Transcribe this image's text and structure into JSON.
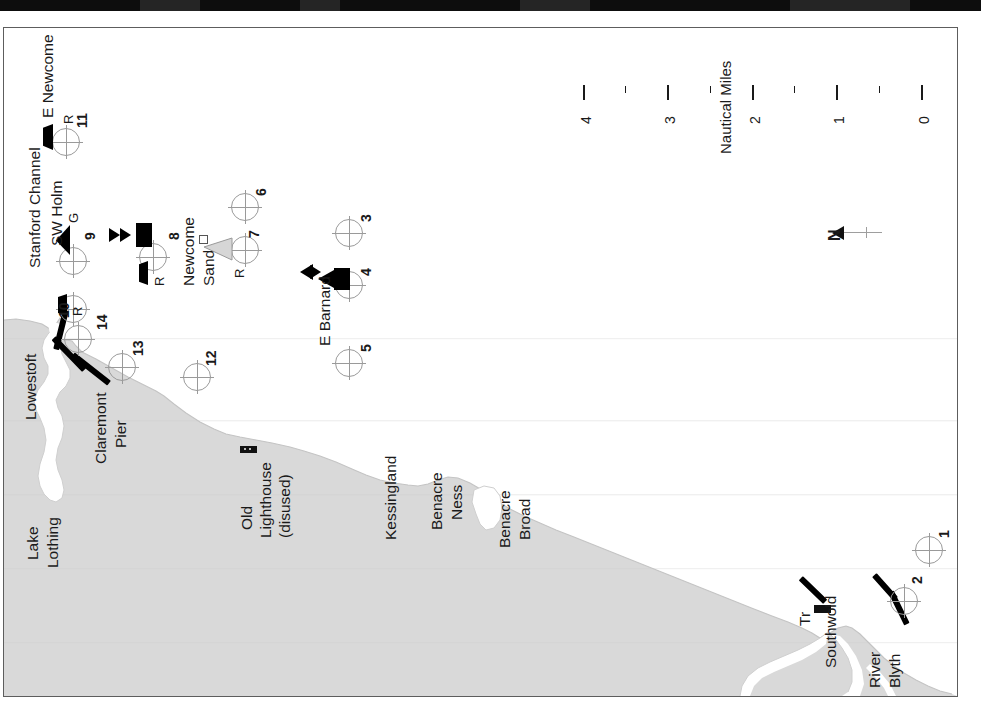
{
  "chart": {
    "kind": "nautical-chart",
    "orientation_note": "N",
    "background_color": "#ffffff",
    "land_color": "#d9d9d9",
    "water_color": "#ffffff",
    "frame_color": "#5d5d5d"
  },
  "scale": {
    "title": "Nautical Miles",
    "major_labels": [
      "0",
      "1",
      "2",
      "3",
      "4"
    ],
    "major_count": 5,
    "minor_count": 4,
    "units": "Nautical Miles"
  },
  "north": {
    "label": "N"
  },
  "places": [
    {
      "name": "Lowestoft"
    },
    {
      "name": "Lake"
    },
    {
      "name": "Lothing"
    },
    {
      "name": "Claremont"
    },
    {
      "name": "Pier"
    },
    {
      "name": "Old"
    },
    {
      "name": "Lighthouse"
    },
    {
      "name": "(disused)"
    },
    {
      "name": "Kessingland"
    },
    {
      "name": "Benacre"
    },
    {
      "name": "Ness"
    },
    {
      "name": "Benacre"
    },
    {
      "name": "Broad"
    },
    {
      "name": "Southwold"
    },
    {
      "name": "River"
    },
    {
      "name": "Blyth"
    },
    {
      "name": "Tr"
    }
  ],
  "sea_areas": [
    {
      "name": "E Newcome"
    },
    {
      "name": "SW Holm"
    },
    {
      "name": "Stanford Channel"
    },
    {
      "name": "Newcome"
    },
    {
      "name": "Sand"
    },
    {
      "name": "E Barnard"
    }
  ],
  "buoy_codes": [
    {
      "code": "R",
      "near": "E Newcome"
    },
    {
      "code": "G",
      "near": "SW Holm"
    },
    {
      "code": "R",
      "near": "10"
    },
    {
      "code": "R",
      "near": "8"
    },
    {
      "code": "R",
      "near": "7"
    }
  ],
  "waypoints": [
    {
      "id": "1"
    },
    {
      "id": "2"
    },
    {
      "id": "3"
    },
    {
      "id": "4"
    },
    {
      "id": "5"
    },
    {
      "id": "6"
    },
    {
      "id": "7"
    },
    {
      "id": "8"
    },
    {
      "id": "9"
    },
    {
      "id": "10"
    },
    {
      "id": "11"
    },
    {
      "id": "12"
    },
    {
      "id": "13"
    },
    {
      "id": "14"
    }
  ],
  "waypoint_labels": {
    "w1": "1",
    "w2": "2",
    "w3": "3",
    "w4": "4",
    "w5": "5",
    "w6": "6",
    "w7": "7",
    "w8": "8",
    "w9": "9",
    "w10": "10",
    "w11": "11",
    "w12": "12",
    "w13": "13",
    "w14": "14"
  },
  "labels": {
    "lowestoft": "Lowestoft",
    "lake": "Lake",
    "lothing": "Lothing",
    "claremont": "Claremont",
    "pier": "Pier",
    "old": "Old",
    "lighthouse": "Lighthouse",
    "disused": "(disused)",
    "kessingland": "Kessingland",
    "benacre": "Benacre",
    "ness": "Ness",
    "benacre2": "Benacre",
    "broad": "Broad",
    "southwold": "Southwold",
    "river": "River",
    "blyth": "Blyth",
    "tr": "Tr",
    "e_newcome": "E Newcome",
    "sw_holm": "SW Holm",
    "stanford_channel": "Stanford Channel",
    "newcome": "Newcome",
    "sand": "Sand",
    "e_barnard": "E Barnard",
    "r1": "R",
    "g1": "G",
    "r2": "R",
    "r3": "R",
    "r4": "R",
    "scale_title": "Nautical Miles",
    "s0": "0",
    "s1": "1",
    "s2": "2",
    "s3": "3",
    "s4": "4",
    "north": "N"
  }
}
